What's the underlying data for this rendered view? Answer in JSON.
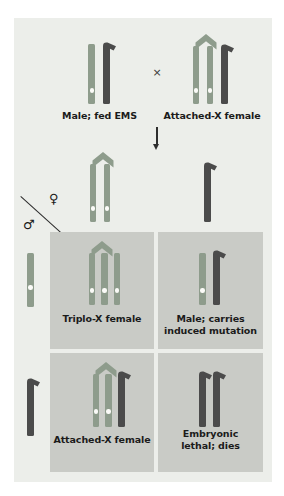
{
  "figure": {
    "panel_background": "#eceeea",
    "cell_background": "#c9cbc6"
  },
  "colors": {
    "x_chromosome": "#8e9c8c",
    "x_chromosome_dark": "#7c8b7b",
    "y_chromosome": "#4b4b4b",
    "centromere": "#fbfbf8",
    "chevron": "#8e9c8c",
    "text": "#1b1b1b",
    "arrow": "#2e2e2e"
  },
  "parents": {
    "cross_symbol": "×",
    "male": {
      "label": "Male; fed EMS",
      "chromosomes": [
        "X",
        "Y"
      ]
    },
    "female": {
      "label": "Attached-X female",
      "chromosomes": [
        "X",
        "X",
        "Y"
      ],
      "attached": true
    }
  },
  "gametes": {
    "arrow": "↓",
    "female_gamete": {
      "name": "attached-X gamete",
      "chromosomes": [
        "X",
        "X"
      ],
      "attached": true
    },
    "female_gamete_2": {
      "name": "Y gamete",
      "chromosomes": [
        "Y"
      ]
    },
    "male_gamete_1": {
      "name": "X gamete",
      "chromosomes": [
        "X"
      ]
    },
    "male_gamete_2": {
      "name": "Y gamete",
      "chromosomes": [
        "Y"
      ]
    }
  },
  "sex_key": {
    "female_symbol": "♀",
    "male_symbol": "♂"
  },
  "punnett": {
    "cells": [
      {
        "id": "triplo-x-female",
        "label": "Triplo-X female",
        "chromosomes": [
          "X",
          "X",
          "X"
        ],
        "attached": true,
        "row": 0,
        "col": 0
      },
      {
        "id": "male-induced-mutation",
        "label": "Male; carries\ninduced mutation",
        "chromosomes": [
          "X",
          "Y"
        ],
        "attached": false,
        "row": 0,
        "col": 1
      },
      {
        "id": "attached-x-female",
        "label": "Attached-X female",
        "chromosomes": [
          "X",
          "X",
          "Y"
        ],
        "attached": true,
        "row": 1,
        "col": 0
      },
      {
        "id": "embryonic-lethal",
        "label": "Embryonic\nlethal; dies",
        "chromosomes": [
          "Y",
          "Y"
        ],
        "attached": false,
        "row": 1,
        "col": 1
      }
    ]
  }
}
